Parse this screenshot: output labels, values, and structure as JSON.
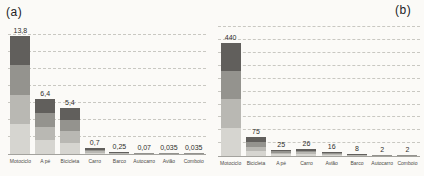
{
  "style": {
    "background": "#fbfaf7",
    "grid_color": "#c9c8c2",
    "axis_color": "#a3a29d",
    "value_label_color": "#2f2f2c",
    "band_colors_bottom_to_top": [
      "#d6d5d0",
      "#b9b8b3",
      "#94938e",
      "#615f5c"
    ]
  },
  "chart_data": [
    {
      "panel": "a",
      "panel_label": "(a)",
      "type": "bar",
      "title": "",
      "xlabel": "",
      "ylabel": "",
      "categories": [
        "Motociclo",
        "A pé",
        "Bicicleta",
        "Carro",
        "Barco",
        "Autocarro",
        "Avião",
        "Comboio"
      ],
      "values": [
        13.8,
        6.4,
        5.4,
        0.7,
        0.25,
        0.07,
        0.035,
        0.035
      ],
      "value_labels": [
        "13,8",
        "6,4",
        "5,4",
        "0,7",
        "0,25",
        "0,07",
        "0,035",
        "0,035"
      ],
      "ylim": [
        0,
        15
      ],
      "grid_step": 2,
      "grid": "dashed-horizontal",
      "legend": "none",
      "bar_style": "gray-gradient-4-bands"
    },
    {
      "panel": "b",
      "panel_label": "(b)",
      "type": "bar",
      "title": "",
      "xlabel": "",
      "ylabel": "",
      "categories": [
        "Motociclo",
        "Bicicleta",
        "A pé",
        "Carro",
        "Avião",
        "Barco",
        "Autocarro",
        "Comboio"
      ],
      "values": [
        440,
        75,
        25,
        26,
        16,
        8,
        2,
        2
      ],
      "value_labels": [
        "440",
        "75",
        "25",
        "26",
        "16",
        "8",
        "2",
        "2"
      ],
      "ylim": [
        0,
        520
      ],
      "grid_step": 50,
      "grid": "dashed-horizontal",
      "legend": "none",
      "bar_style": "gray-gradient-4-bands"
    }
  ]
}
